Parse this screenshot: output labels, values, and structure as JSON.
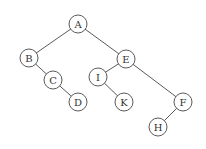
{
  "diagram": {
    "type": "binary-tree",
    "node_radius": 9,
    "colors": {
      "background": "#ffffff",
      "stroke": "#5a5a5a",
      "label": "#333333"
    },
    "nodes": [
      {
        "id": "A",
        "label": "A",
        "x": 78,
        "y": 24
      },
      {
        "id": "B",
        "label": "B",
        "x": 29,
        "y": 58
      },
      {
        "id": "C",
        "label": "C",
        "x": 53,
        "y": 80
      },
      {
        "id": "D",
        "label": "D",
        "x": 78,
        "y": 102
      },
      {
        "id": "E",
        "label": "E",
        "x": 126,
        "y": 59
      },
      {
        "id": "I",
        "label": "I",
        "x": 98,
        "y": 77
      },
      {
        "id": "K",
        "label": "K",
        "x": 124,
        "y": 102
      },
      {
        "id": "F",
        "label": "F",
        "x": 183,
        "y": 102
      },
      {
        "id": "H",
        "label": "H",
        "x": 158,
        "y": 127
      }
    ],
    "edges": [
      {
        "from": "A",
        "to": "B"
      },
      {
        "from": "A",
        "to": "E"
      },
      {
        "from": "B",
        "to": "C"
      },
      {
        "from": "C",
        "to": "D"
      },
      {
        "from": "E",
        "to": "I"
      },
      {
        "from": "E",
        "to": "F"
      },
      {
        "from": "I",
        "to": "K"
      },
      {
        "from": "F",
        "to": "H"
      }
    ]
  }
}
